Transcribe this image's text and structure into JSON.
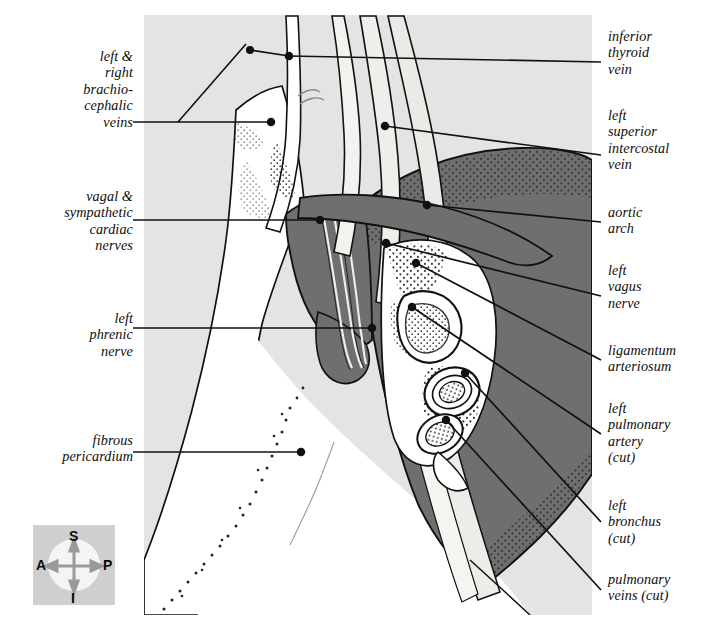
{
  "figure": {
    "kind": "anatomical-illustration",
    "panel": {
      "x": 144,
      "y": 15,
      "width": 448,
      "height": 600
    },
    "colors": {
      "page_background": "#ffffff",
      "panel_background": "#e4e4e4",
      "tissue_light": "#ffffff",
      "tissue_dark_gray": "#6f6f6f",
      "tissue_mid_gray": "#d8d6d2",
      "outline": "#111111",
      "leader_line": "#111111",
      "compass_box": "#cfcfcf",
      "compass_disc": "#f2f2f2",
      "compass_arrow": "#9a9a9a"
    }
  },
  "labels_left": [
    {
      "id": "brachiocephalic-veins",
      "text": "left &\nright\nbrachio-\ncephalic\nveins",
      "text_top": 48,
      "leader": {
        "x1": 133,
        "y1": 122,
        "x2": 271,
        "y2": 122,
        "bend_x": 178,
        "bend_y": 122,
        "tip_x": 271,
        "tip_y": 122
      }
    },
    {
      "id": "vagal-sympathetic-cardiac-nerves",
      "text": "vagal &\nsympathetic\ncardiac\nnerves",
      "text_top": 188,
      "leader": {
        "x1": 133,
        "y1": 220,
        "x2": 320,
        "y2": 220,
        "bend_x": 240,
        "bend_y": 220,
        "tip_x": 320,
        "tip_y": 220
      }
    },
    {
      "id": "left-phrenic-nerve",
      "text": "left\nphrenic\nnerve",
      "text_top": 310,
      "leader": {
        "x1": 133,
        "y1": 328,
        "x2": 372,
        "y2": 328,
        "bend_x": 300,
        "bend_y": 328,
        "tip_x": 372,
        "tip_y": 328
      }
    },
    {
      "id": "fibrous-pericardium",
      "text": "fibrous\npericardium",
      "text_top": 432,
      "leader": {
        "x1": 133,
        "y1": 452,
        "x2": 301,
        "y2": 452,
        "bend_x": 240,
        "bend_y": 452,
        "tip_x": 301,
        "tip_y": 452
      }
    }
  ],
  "labels_right": [
    {
      "id": "inferior-thyroid-vein",
      "text": "inferior\nthyroid\nvein",
      "text_top": 28,
      "leader": {
        "x1": 601,
        "y1": 62,
        "x2": 289,
        "y2": 56,
        "tip_x": 289,
        "tip_y": 56
      }
    },
    {
      "id": "left-superior-intercostal-vein",
      "text": "left\nsuperior\nintercostal\nvein",
      "text_top": 107,
      "leader": {
        "x1": 601,
        "y1": 155,
        "x2": 385,
        "y2": 126,
        "tip_x": 385,
        "tip_y": 126
      }
    },
    {
      "id": "aortic-arch",
      "text": "aortic\narch",
      "text_top": 204,
      "leader": {
        "x1": 601,
        "y1": 222,
        "x2": 427,
        "y2": 205,
        "tip_x": 427,
        "tip_y": 205
      }
    },
    {
      "id": "left-vagus-nerve",
      "text": "left\nvagus\nnerve",
      "text_top": 262,
      "leader": {
        "x1": 601,
        "y1": 296,
        "x2": 386,
        "y2": 243,
        "tip_x": 386,
        "tip_y": 243
      }
    },
    {
      "id": "ligamentum-arteriosum",
      "text": "ligamentum\narteriosum",
      "text_top": 342,
      "leader": {
        "x1": 601,
        "y1": 360,
        "x2": 416,
        "y2": 263,
        "tip_x": 416,
        "tip_y": 263
      }
    },
    {
      "id": "left-pulmonary-artery-cut",
      "text": "left\npulmonary\nartery\n(cut)",
      "text_top": 400,
      "leader": {
        "x1": 601,
        "y1": 434,
        "x2": 412,
        "y2": 307,
        "tip_x": 412,
        "tip_y": 307
      }
    },
    {
      "id": "left-bronchus-cut",
      "text": "left\nbronchus\n(cut)",
      "text_top": 497,
      "leader": {
        "x1": 601,
        "y1": 522,
        "x2": 465,
        "y2": 373,
        "tip_x": 465,
        "tip_y": 373
      }
    },
    {
      "id": "pulmonary-veins-cut",
      "text": "pulmonary\nveins (cut)",
      "text_top": 571,
      "leader": {
        "x1": 601,
        "y1": 590,
        "x2": 446,
        "y2": 420,
        "tip_x": 446,
        "tip_y": 420
      }
    }
  ],
  "compass": {
    "name": "orientation-key",
    "box": {
      "x": 33,
      "y": 525,
      "width": 82,
      "height": 80
    },
    "superior": "S",
    "inferior": "I",
    "anterior": "A",
    "posterior": "P"
  }
}
